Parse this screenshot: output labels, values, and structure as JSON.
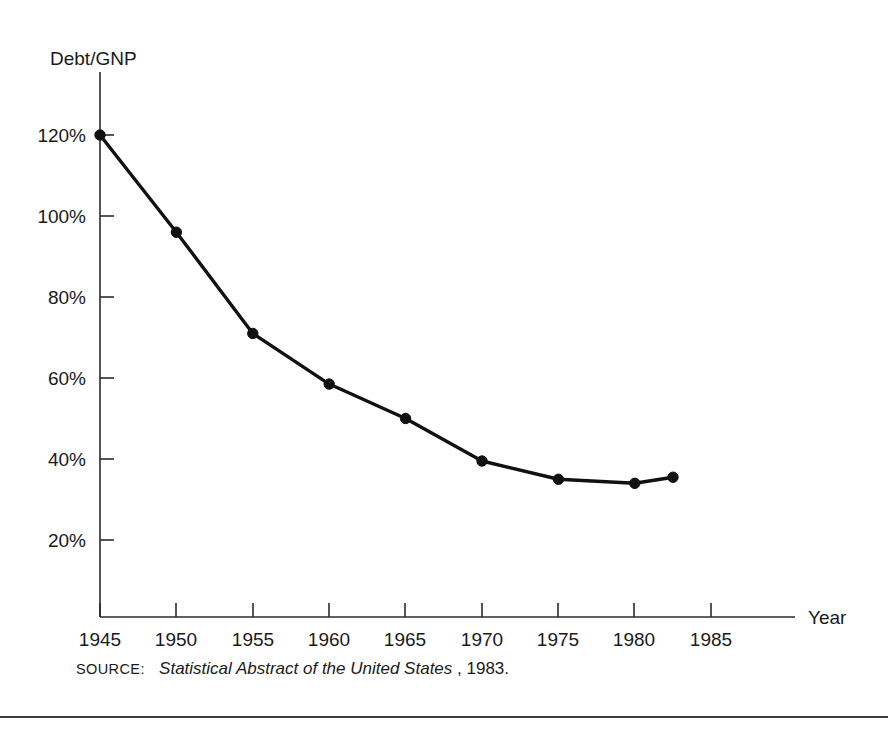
{
  "figure": {
    "y_axis_label": "Debt/GNP",
    "x_axis_label": "Year",
    "y_ticks": [
      "120%",
      "100%",
      "80%",
      "60%",
      "40%",
      "20%"
    ],
    "x_ticks": [
      "1945",
      "1950",
      "1955",
      "1960",
      "1965",
      "1970",
      "1975",
      "1980",
      "1985"
    ],
    "source": {
      "kicker": "SOURCE:",
      "title": "Statistical Abstract of the United States",
      "suffix": ", 1983."
    },
    "colors": {
      "line": "#111111",
      "axis": "#2b2b2b",
      "text": "#1a1a1a",
      "background": "#ffffff"
    }
  },
  "chart_data": {
    "type": "line",
    "title": "",
    "subtitle": "",
    "xlabel": "Year",
    "ylabel": "Debt/GNP",
    "xlim": [
      1943,
      1988
    ],
    "ylim": [
      0,
      130
    ],
    "grid": false,
    "legend": null,
    "y_tick_values": [
      120,
      100,
      80,
      60,
      40,
      20
    ],
    "y_tick_labels": [
      "120%",
      "100%",
      "80%",
      "60%",
      "40%",
      "20%"
    ],
    "x_tick_values": [
      1945,
      1950,
      1955,
      1960,
      1965,
      1970,
      1975,
      1980,
      1985
    ],
    "x_tick_labels": [
      "1945",
      "1950",
      "1955",
      "1960",
      "1965",
      "1970",
      "1975",
      "1980",
      "1985"
    ],
    "series": [
      {
        "name": "Debt/GNP",
        "x": [
          1945,
          1950,
          1955,
          1960,
          1965,
          1970,
          1975,
          1980,
          1982.5
        ],
        "values": [
          120,
          96,
          71,
          58.5,
          50,
          39.5,
          35,
          34,
          35.5
        ],
        "marker": "circle",
        "color": "#111111"
      }
    ],
    "annotations": [
      "SOURCE: Statistical Abstract of the United States, 1983."
    ]
  }
}
